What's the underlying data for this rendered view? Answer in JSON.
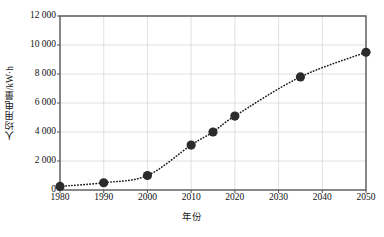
{
  "chart_data": {
    "type": "line",
    "title": "",
    "subtitle": "",
    "xlabel": "年份",
    "ylabel": "人均用电量/kW·h",
    "xlim": [
      1980,
      2050
    ],
    "ylim": [
      0,
      12000
    ],
    "grid": true,
    "legend": null,
    "marker": "filled-circle",
    "line_style": "dotted",
    "line_color": "#1a1a1a",
    "marker_color": "#2b2b2b",
    "grid_color": "#d8d8d8",
    "frame_color": "#555555",
    "xticks": [
      1980,
      1990,
      2000,
      2010,
      2020,
      2030,
      2040,
      2050
    ],
    "xtick_labels": [
      "1980",
      "1990",
      "2000",
      "2010",
      "2020",
      "2030",
      "2040",
      "2050"
    ],
    "yticks": [
      0,
      2000,
      4000,
      6000,
      8000,
      10000,
      12000
    ],
    "ytick_labels": [
      "0",
      "2 000",
      "4 000",
      "6 000",
      "8 000",
      "10 000",
      "12 000"
    ],
    "x": [
      1980,
      1990,
      2000,
      2010,
      2015,
      2020,
      2035,
      2050
    ],
    "values": [
      250,
      500,
      1000,
      3100,
      4000,
      5100,
      7800,
      9500
    ],
    "points": [
      {
        "x": 1980,
        "y": 250
      },
      {
        "x": 1990,
        "y": 500
      },
      {
        "x": 2000,
        "y": 1000
      },
      {
        "x": 2010,
        "y": 3100
      },
      {
        "x": 2015,
        "y": 4000
      },
      {
        "x": 2020,
        "y": 5100
      },
      {
        "x": 2035,
        "y": 7800
      },
      {
        "x": 2050,
        "y": 9500
      }
    ]
  }
}
